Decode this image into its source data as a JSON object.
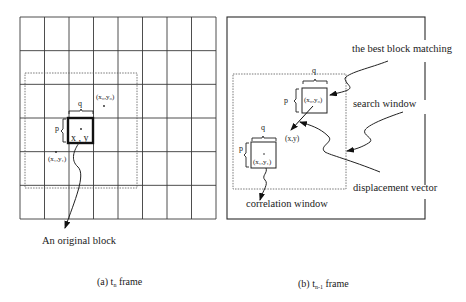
{
  "figure": {
    "left_panel": {
      "grid": {
        "columns": 8,
        "rows": 6
      },
      "labels": {
        "q": "q",
        "p": "p",
        "center": "x , y",
        "best_point": "(x₀,y₀)",
        "corr_point": "(x₁,y₁)",
        "original_block": "An original block"
      },
      "caption": {
        "prefix": "(a) t",
        "subscript": "n",
        "suffix": " frame"
      }
    },
    "right_panel": {
      "labels": {
        "q_top": "q",
        "p_top": "p",
        "best_point": "(x₀,y₀)",
        "center": "(x,y)",
        "q_bottom": "q",
        "p_bottom": "p",
        "corr_point": "(x₁,y₁)",
        "best_block_matching": "the best block matching",
        "search_window": "search window",
        "displacement_vector": "displacement vector",
        "correlation_window": "correlation window"
      },
      "caption": {
        "prefix": "(b) t",
        "subscript": "n-1",
        "suffix": " frame"
      }
    }
  }
}
